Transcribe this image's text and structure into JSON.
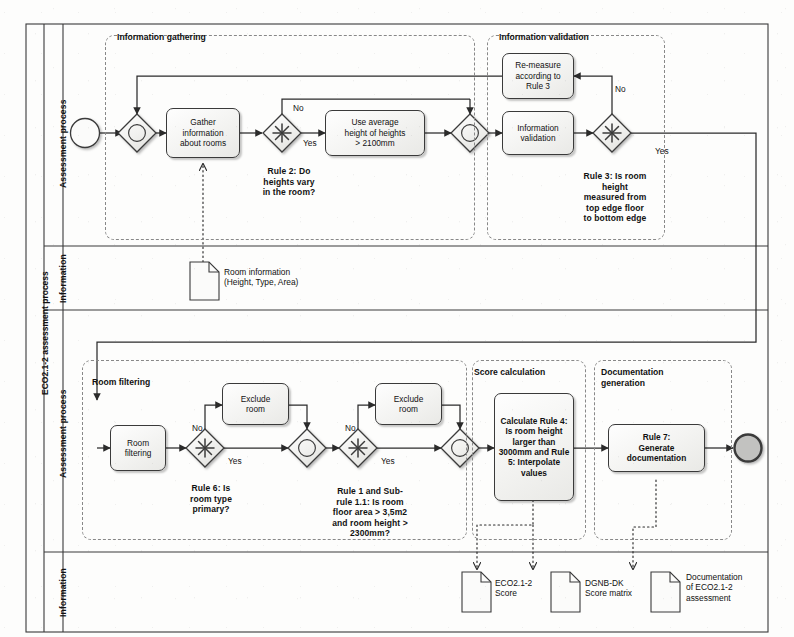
{
  "diagram": {
    "type": "bpmn-process-diagram",
    "pool_title": "ECO2.1-2 assessment process",
    "lanes": [
      {
        "id": "lane-assessment-top",
        "label": "Assessment process"
      },
      {
        "id": "lane-information-top",
        "label": "Information"
      },
      {
        "id": "lane-assessment-bottom",
        "label": "Assessment process"
      },
      {
        "id": "lane-information-bottom",
        "label": "Information"
      }
    ],
    "groups": [
      {
        "id": "group-information-gathering",
        "label": "Information gathering"
      },
      {
        "id": "group-information-validation",
        "label": "Information validation"
      },
      {
        "id": "group-room-filtering",
        "label": "Room filtering"
      },
      {
        "id": "group-score-calculation",
        "label": "Score calculation"
      },
      {
        "id": "group-documentation-generation",
        "label": "Documentation\ngeneration"
      }
    ],
    "events": [
      {
        "id": "start-event",
        "kind": "start",
        "label": ""
      },
      {
        "id": "end-event",
        "kind": "end",
        "label": ""
      }
    ],
    "tasks": [
      {
        "id": "task-gather-information",
        "label": "Gather\ninformation\nabout rooms",
        "bold": false
      },
      {
        "id": "task-use-average-height",
        "label": "Use average\nheight of heights\n> 2100mm",
        "bold": false
      },
      {
        "id": "task-remeasure",
        "label": "Re-measure\naccording to\nRule 3",
        "bold": false
      },
      {
        "id": "task-information-validation",
        "label": "Information\nvalidation",
        "bold": false
      },
      {
        "id": "task-room-filtering",
        "label": "Room\nfiltering",
        "bold": false
      },
      {
        "id": "task-exclude-room-1",
        "label": "Exclude\nroom",
        "bold": false
      },
      {
        "id": "task-exclude-room-2",
        "label": "Exclude\nroom",
        "bold": false
      },
      {
        "id": "task-calculate-rule4",
        "label": "Calculate Rule 4:\nIs room height\nlarger than\n3000mm and Rule\n5: Interpolate\nvalues",
        "bold": true
      },
      {
        "id": "task-generate-documentation",
        "label": "Rule 7:\nGenerate\ndocumentation",
        "bold": true
      }
    ],
    "gateways": [
      {
        "id": "gateway-merge-1",
        "kind": "inclusive-merge",
        "label": ""
      },
      {
        "id": "gateway-rule2",
        "kind": "complex-decision",
        "label": "Rule 2: Do\nheights vary\nin the room?"
      },
      {
        "id": "gateway-merge-2",
        "kind": "inclusive-merge",
        "label": ""
      },
      {
        "id": "gateway-rule3",
        "kind": "complex-decision",
        "label": "Rule 3: Is room\nheight\nmeasured from\ntop edge floor\nto bottom edge"
      },
      {
        "id": "gateway-rule6",
        "kind": "complex-decision",
        "label": "Rule 6: Is\nroom type\nprimary?"
      },
      {
        "id": "gateway-merge-3",
        "kind": "inclusive-merge",
        "label": ""
      },
      {
        "id": "gateway-rule1",
        "kind": "complex-decision",
        "label": "Rule 1 and Sub-\nrule 1.1: Is room\nfloor area > 3,5m2\nand room height >\n2300mm?"
      },
      {
        "id": "gateway-merge-4",
        "kind": "inclusive-merge",
        "label": ""
      }
    ],
    "flow_labels": [
      {
        "id": "flow-label-rule2-no",
        "text": "No"
      },
      {
        "id": "flow-label-rule2-yes",
        "text": "Yes"
      },
      {
        "id": "flow-label-rule3-no",
        "text": "No"
      },
      {
        "id": "flow-label-rule3-yes",
        "text": "Yes"
      },
      {
        "id": "flow-label-rule6-no",
        "text": "No"
      },
      {
        "id": "flow-label-rule6-yes",
        "text": "Yes"
      },
      {
        "id": "flow-label-rule1-no",
        "text": "No"
      },
      {
        "id": "flow-label-rule1-yes",
        "text": "Yes"
      }
    ],
    "data_objects": [
      {
        "id": "data-room-information",
        "label": "Room information\n(Height, Type, Area)"
      },
      {
        "id": "data-eco-score",
        "label": "ECO2.1-2\nScore"
      },
      {
        "id": "data-dgnb-matrix",
        "label": "DGNB-DK\nScore matrix"
      },
      {
        "id": "data-documentation",
        "label": "Documentation\nof ECO2.1-2\nassessment"
      }
    ],
    "colors": {
      "stroke": "#3a3a3a",
      "line": "#2b2b2b",
      "task_fill": "#f2f2f0",
      "group_stroke": "#888888",
      "end_event_fill": "#bfbfbf",
      "background": "#fdfdfc"
    }
  }
}
